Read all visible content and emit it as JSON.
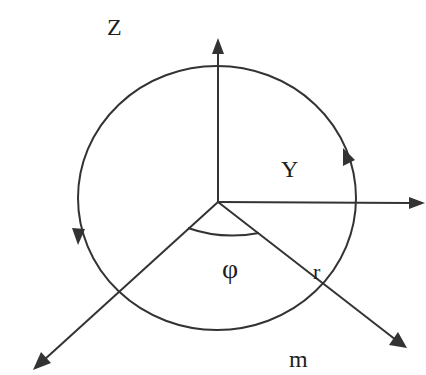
{
  "diagram": {
    "colors": {
      "stroke": "#333333",
      "text": "#1e1e1e",
      "background": "#ffffff"
    },
    "labels": {
      "z_axis": "Z",
      "y_axis": "Y",
      "angle": "φ",
      "radius": "r",
      "mass": "m"
    },
    "elements": {
      "origin": {
        "x": 218,
        "y": 202
      },
      "circle": {
        "cx": 217,
        "cy": 198,
        "rx": 139,
        "ry": 132
      },
      "axes": [
        {
          "name": "z-axis",
          "to": {
            "x": 218,
            "y": 40
          }
        },
        {
          "name": "y-axis",
          "to": {
            "x": 424,
            "y": 203
          }
        },
        {
          "name": "lower-left-axis",
          "to": {
            "x": 35,
            "y": 368
          }
        },
        {
          "name": "radius-axis",
          "to": {
            "x": 405,
            "y": 347
          }
        }
      ],
      "rotation_arrows": [
        {
          "position": "right",
          "direction": "up"
        },
        {
          "position": "left",
          "direction": "down"
        }
      ]
    }
  }
}
